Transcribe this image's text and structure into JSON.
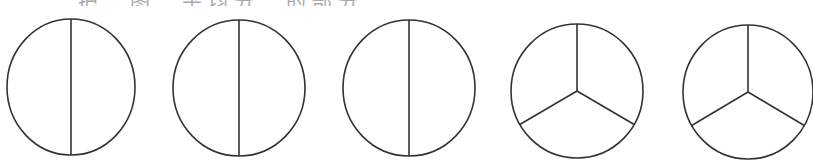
{
  "header": {
    "clipped_text": "　　　把　图　平均分　的部分"
  },
  "diagram": {
    "stroke_color": "#333333",
    "stroke_width": 1.6,
    "circles": [
      {
        "id": "circle-1",
        "cx": 71,
        "cy": 87,
        "rx": 64,
        "ry": 68,
        "parts": 2
      },
      {
        "id": "circle-2",
        "cx": 239,
        "cy": 88,
        "rx": 66,
        "ry": 68,
        "parts": 2
      },
      {
        "id": "circle-3",
        "cx": 409,
        "cy": 88,
        "rx": 66,
        "ry": 68,
        "parts": 2
      },
      {
        "id": "circle-4",
        "cx": 577,
        "cy": 91,
        "rx": 66,
        "ry": 67,
        "parts": 3
      },
      {
        "id": "circle-5",
        "cx": 748,
        "cy": 92,
        "rx": 65,
        "ry": 67,
        "parts": 3
      }
    ]
  }
}
